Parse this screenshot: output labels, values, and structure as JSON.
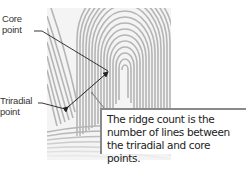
{
  "labels": {
    "core": [
      "Core",
      "point"
    ],
    "triradial": [
      "Triradial",
      "point"
    ]
  },
  "caption": {
    "lines": [
      "The ridge count is the",
      "number of lines between",
      "the triradial and core points."
    ]
  },
  "colors": {
    "ridge": "#b8b8b8",
    "leader": "#222222",
    "box_border": "#8a8a8a"
  }
}
